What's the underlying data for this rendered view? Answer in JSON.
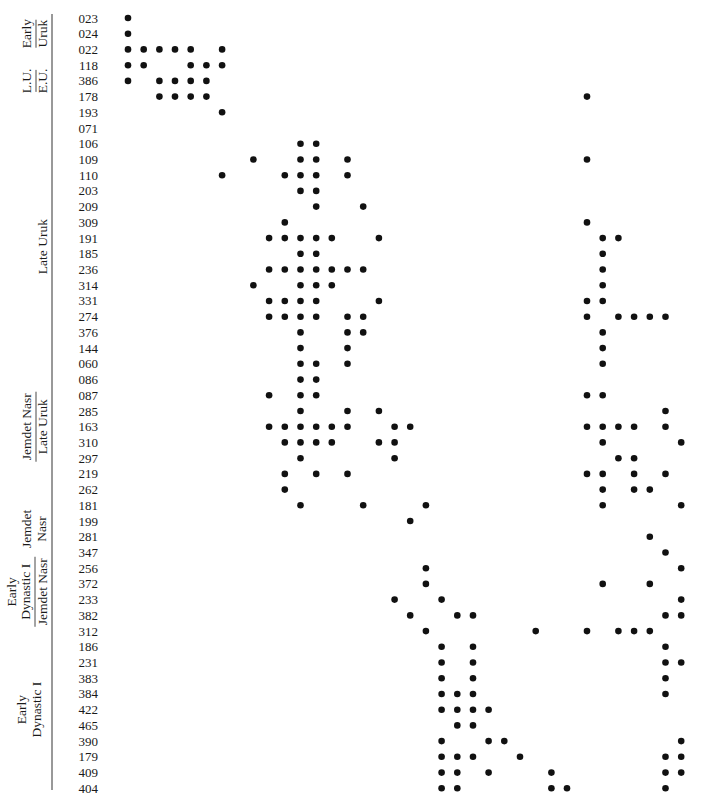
{
  "chart_data": {
    "type": "seriation-matrix",
    "title": "",
    "period_groups": [
      {
        "rows": [
          "023",
          "024",
          "022"
        ],
        "top": "Early",
        "bottom": "Uruk",
        "stacked": true
      },
      {
        "rows": [
          "118",
          "386",
          "178"
        ],
        "top": "L.U.",
        "bottom": "E.U.",
        "stacked": true
      },
      {
        "rows": [
          "193",
          "071",
          "106",
          "109",
          "110",
          "203",
          "209",
          "309",
          "191",
          "185",
          "236",
          "314",
          "331"
        ],
        "label": "Late Uruk"
      },
      {
        "rows": [
          "087",
          "285",
          "163",
          "310",
          "297"
        ],
        "top": "Jemdet Nasr",
        "bottom": "Late Uruk",
        "stacked": true
      },
      {
        "rows": [
          "181",
          "199",
          "281",
          "347"
        ],
        "top": "Jemdet",
        "bottom": "Nasr",
        "stacked": false
      },
      {
        "rows": [
          "256",
          "372",
          "233",
          "382"
        ],
        "top": "Early",
        "middle": "Dynastic I",
        "bottom": "Jemdet Nasr",
        "stacked": true
      },
      {
        "rows": [
          "384",
          "422",
          "465"
        ],
        "top": "Early",
        "bottom": "Dynastic I",
        "stacked": false
      }
    ],
    "column_count": 36,
    "rows": [
      {
        "id": "023",
        "cols": [
          0
        ]
      },
      {
        "id": "024",
        "cols": [
          0
        ]
      },
      {
        "id": "022",
        "cols": [
          0,
          1,
          2,
          3,
          4,
          6
        ]
      },
      {
        "id": "118",
        "cols": [
          0,
          1,
          4,
          5,
          6
        ]
      },
      {
        "id": "386",
        "cols": [
          0,
          2,
          3,
          4,
          5
        ]
      },
      {
        "id": "178",
        "cols": [
          2,
          3,
          4,
          5,
          29
        ]
      },
      {
        "id": "193",
        "cols": [
          6
        ]
      },
      {
        "id": "071",
        "cols": []
      },
      {
        "id": "106",
        "cols": [
          11,
          12
        ]
      },
      {
        "id": "109",
        "cols": [
          8,
          11,
          12,
          14,
          29
        ]
      },
      {
        "id": "110",
        "cols": [
          6,
          10,
          11,
          12,
          14
        ]
      },
      {
        "id": "203",
        "cols": [
          11,
          12
        ]
      },
      {
        "id": "209",
        "cols": [
          12,
          15
        ]
      },
      {
        "id": "309",
        "cols": [
          10,
          29
        ]
      },
      {
        "id": "191",
        "cols": [
          9,
          10,
          11,
          12,
          13,
          16,
          30,
          31
        ]
      },
      {
        "id": "185",
        "cols": [
          11,
          12,
          30
        ]
      },
      {
        "id": "236",
        "cols": [
          9,
          10,
          11,
          12,
          13,
          14,
          15,
          30
        ]
      },
      {
        "id": "314",
        "cols": [
          8,
          11,
          12,
          13,
          30
        ]
      },
      {
        "id": "331",
        "cols": [
          9,
          10,
          11,
          12,
          16,
          29,
          30
        ]
      },
      {
        "id": "274",
        "cols": [
          9,
          10,
          11,
          12,
          14,
          15,
          29,
          31,
          32,
          33,
          34
        ]
      },
      {
        "id": "376",
        "cols": [
          11,
          14,
          15,
          30
        ]
      },
      {
        "id": "144",
        "cols": [
          11,
          14,
          30
        ]
      },
      {
        "id": "060",
        "cols": [
          11,
          12,
          14,
          30
        ]
      },
      {
        "id": "086",
        "cols": [
          11,
          12
        ]
      },
      {
        "id": "087",
        "cols": [
          9,
          11,
          12,
          29,
          30
        ]
      },
      {
        "id": "285",
        "cols": [
          11,
          14,
          16,
          34
        ]
      },
      {
        "id": "163",
        "cols": [
          9,
          10,
          11,
          12,
          13,
          14,
          17,
          18,
          29,
          30,
          31,
          32,
          34
        ]
      },
      {
        "id": "310",
        "cols": [
          10,
          11,
          12,
          13,
          16,
          17,
          30,
          35
        ]
      },
      {
        "id": "297",
        "cols": [
          11,
          17,
          31,
          32
        ]
      },
      {
        "id": "219",
        "cols": [
          10,
          12,
          14,
          29,
          30,
          32,
          34
        ]
      },
      {
        "id": "262",
        "cols": [
          10,
          30,
          32,
          33
        ]
      },
      {
        "id": "181",
        "cols": [
          11,
          15,
          19,
          30,
          35
        ]
      },
      {
        "id": "199",
        "cols": [
          18
        ]
      },
      {
        "id": "281",
        "cols": [
          33
        ]
      },
      {
        "id": "347",
        "cols": [
          34
        ]
      },
      {
        "id": "256",
        "cols": [
          19,
          35
        ]
      },
      {
        "id": "372",
        "cols": [
          19,
          30,
          33
        ]
      },
      {
        "id": "233",
        "cols": [
          17,
          20,
          35
        ]
      },
      {
        "id": "382",
        "cols": [
          18,
          21,
          22,
          34,
          35
        ]
      },
      {
        "id": "312",
        "cols": [
          19,
          26,
          29,
          31,
          32,
          33
        ]
      },
      {
        "id": "186",
        "cols": [
          20,
          22,
          34
        ]
      },
      {
        "id": "231",
        "cols": [
          20,
          22,
          34,
          35
        ]
      },
      {
        "id": "383",
        "cols": [
          20,
          22,
          34
        ]
      },
      {
        "id": "384",
        "cols": [
          20,
          21,
          22,
          34
        ]
      },
      {
        "id": "422",
        "cols": [
          20,
          21,
          22,
          23
        ]
      },
      {
        "id": "465",
        "cols": [
          21,
          22
        ]
      },
      {
        "id": "390",
        "cols": [
          20,
          23,
          24,
          35
        ]
      },
      {
        "id": "179",
        "cols": [
          20,
          21,
          22,
          25,
          34,
          35
        ]
      },
      {
        "id": "409",
        "cols": [
          20,
          21,
          23,
          27,
          34,
          35
        ]
      },
      {
        "id": "404",
        "cols": [
          20,
          21,
          27,
          28,
          34
        ]
      }
    ]
  }
}
